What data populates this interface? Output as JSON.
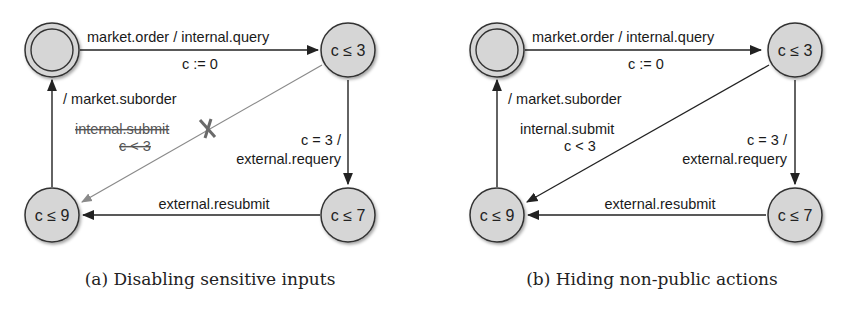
{
  "figure": {
    "panels": [
      {
        "id": "a",
        "caption": "(a) Disabling sensitive inputs",
        "states": {
          "initial": "",
          "s1": "c ≤ 3",
          "s2": "c ≤ 7",
          "s3": "c ≤ 9"
        },
        "edges": {
          "init_to_s1_label": "market.order / internal.query",
          "init_to_s1_reset": "c := 0",
          "s3_to_init_label": "/ market.suborder",
          "s1_to_s3_label": "internal.submit",
          "s1_to_s3_guard": "c < 3",
          "s1_to_s3_status": "disabled",
          "s1_to_s2_guard": "c = 3 /",
          "s1_to_s2_label": "external.requery",
          "s2_to_s3_label": "external.resubmit"
        }
      },
      {
        "id": "b",
        "caption": "(b) Hiding non-public actions",
        "states": {
          "initial": "",
          "s1": "c ≤ 3",
          "s2": "c ≤ 7",
          "s3": "c ≤ 9"
        },
        "edges": {
          "init_to_s1_label": "market.order / internal.query",
          "init_to_s1_reset": "c := 0",
          "s3_to_init_label": "/ market.suborder",
          "s1_to_s3_label": "internal.submit",
          "s1_to_s3_guard": "c < 3",
          "s1_to_s3_status": "enabled",
          "s1_to_s2_guard": "c = 3 /",
          "s1_to_s2_label": "external.requery",
          "s2_to_s3_label": "external.resubmit"
        }
      }
    ],
    "colors": {
      "node_fill": "#d6d6d6",
      "node_stroke": "#333333",
      "edge": "#222222",
      "disabled_edge": "#8a8a8a"
    }
  }
}
